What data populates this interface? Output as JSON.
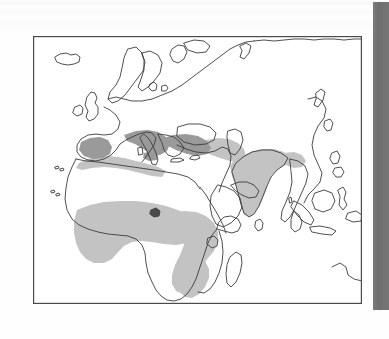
{
  "document": {
    "kind": "scanned-book-page",
    "background_color": "#fefefe",
    "page_width": 389,
    "page_height": 339
  },
  "gutter_band": {
    "name": "page-gutter-shadow",
    "color": "#6e6e6e",
    "x": 373,
    "y": 2,
    "width": 16,
    "height": 308
  },
  "figure": {
    "title": "",
    "caption": "",
    "frame": {
      "x": 32,
      "y": 35,
      "width": 331,
      "height": 270,
      "border_color": "#4a4a4a",
      "fill_color": "#ffffff"
    },
    "projection_note": "",
    "coastline_color": "#3c3c3c",
    "shading": {
      "light_fill": "#c3c3c3",
      "dark_fill": "#9a9a9a",
      "legend_label_light": "",
      "legend_label_dark": ""
    }
  },
  "chart_data": {
    "type": "map",
    "title": "",
    "xlabel": "",
    "ylabel": "",
    "region_extent": {
      "west_longitude": -25,
      "east_longitude": 130,
      "north_latitude": 72,
      "south_latitude": -36
    },
    "legend": [
      {
        "key": "light_fill",
        "color": "#c3c3c3",
        "label": ""
      },
      {
        "key": "dark_fill",
        "color": "#9a9a9a",
        "label": ""
      }
    ],
    "shaded_regions": [
      {
        "name": "sahel-west-africa",
        "fill": "light_fill"
      },
      {
        "name": "central-africa",
        "fill": "light_fill"
      },
      {
        "name": "east-and-southern-africa",
        "fill": "light_fill"
      },
      {
        "name": "north-african-coastal-strip",
        "fill": "light_fill"
      },
      {
        "name": "iberian-peninsula",
        "fill": "dark_fill"
      },
      {
        "name": "italy-and-balkans",
        "fill": "dark_fill"
      },
      {
        "name": "anatolia-turkey",
        "fill": "dark_fill"
      },
      {
        "name": "caucasus-and-northern-iran",
        "fill": "light_fill"
      },
      {
        "name": "indian-subcontinent",
        "fill": "light_fill"
      }
    ],
    "unshaded_regions": [
      {
        "name": "iceland"
      },
      {
        "name": "british-isles"
      },
      {
        "name": "scandinavia"
      },
      {
        "name": "northern-europe-and-russia"
      },
      {
        "name": "sahara-desert"
      },
      {
        "name": "arabian-peninsula"
      },
      {
        "name": "horn-of-africa"
      },
      {
        "name": "madagascar"
      },
      {
        "name": "sri-lanka"
      },
      {
        "name": "southeast-asia"
      },
      {
        "name": "indonesia"
      },
      {
        "name": "philippines"
      },
      {
        "name": "east-asia-china"
      },
      {
        "name": "novaya-zemlya"
      }
    ]
  }
}
